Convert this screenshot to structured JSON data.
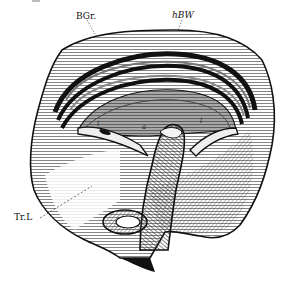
{
  "figure": {
    "labels": {
      "top_left": "BGr.",
      "top_right": "hBW",
      "left": "Tr.L",
      "inner_left": "l",
      "inner_center": "a",
      "inner_right": "l"
    },
    "colors": {
      "ink": "#111111",
      "paper": "#ffffff",
      "mid_tone": "#6a6a6a",
      "light_tone": "#cfcfcf"
    }
  }
}
